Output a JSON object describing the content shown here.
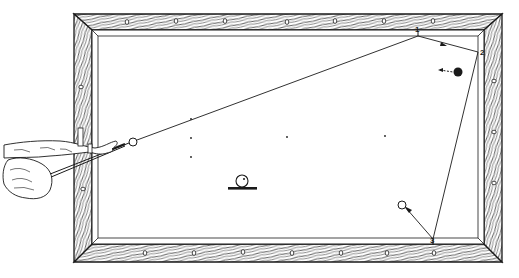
{
  "diagram": {
    "type": "billiards-shot-illustration",
    "colors": {
      "ink": "#1a1a1a",
      "wood_fill": "#ffffff",
      "cloth": "#ffffff"
    },
    "table": {
      "outer_rail": {
        "x": 74,
        "y": 14,
        "w": 428,
        "h": 248
      },
      "inner_cushion": {
        "x": 92,
        "y": 30,
        "w": 392,
        "h": 214
      },
      "diamonds_top": [
        127,
        176,
        225,
        275,
        324,
        373,
        422,
        454
      ],
      "diamonds_bottom": [
        145,
        194,
        243,
        292,
        341,
        392,
        434
      ],
      "diamonds_left": [
        88,
        176
      ],
      "diamonds_right": [
        81,
        132,
        182
      ]
    },
    "cushion_points": [
      {
        "id": "1",
        "label": "1",
        "x": 418,
        "y": 36
      },
      {
        "id": "2",
        "label": "2",
        "x": 478,
        "y": 52
      },
      {
        "id": "3",
        "label": "3",
        "x": 433,
        "y": 239
      }
    ],
    "balls": {
      "cue_ball": {
        "x": 133,
        "y": 142,
        "r": 4,
        "fill": "#ffffff"
      },
      "object_ball_black": {
        "x": 458,
        "y": 72,
        "r": 4.5,
        "fill": "#1a1a1a"
      },
      "object_ball_white": {
        "x": 402,
        "y": 205,
        "r": 4,
        "fill": "#ffffff"
      }
    },
    "spots": [
      {
        "x": 191,
        "y": 119
      },
      {
        "x": 191,
        "y": 138
      },
      {
        "x": 191,
        "y": 157
      },
      {
        "x": 287,
        "y": 137
      },
      {
        "x": 385,
        "y": 136
      }
    ],
    "english_indicator": {
      "label": "cue-ball-english-diagram",
      "x": 242,
      "y": 181,
      "r": 6,
      "dot_dx": 2,
      "dot_dy": -2,
      "bar": {
        "x1": 228,
        "x2": 257,
        "y": 188
      }
    }
  }
}
